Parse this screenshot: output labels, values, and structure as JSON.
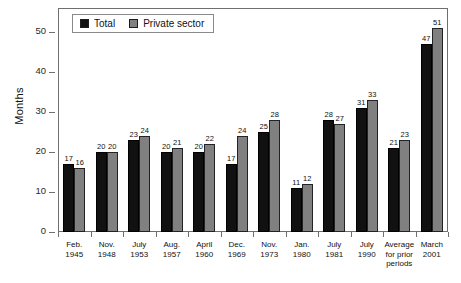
{
  "chart_data": {
    "type": "bar",
    "title": "",
    "xlabel": "",
    "ylabel": "Months",
    "ylim": [
      0,
      55
    ],
    "yticks": [
      0,
      10,
      20,
      30,
      40,
      50
    ],
    "grid": false,
    "legend_position": "top-left",
    "categories": [
      "Feb. 1945",
      "Nov. 1948",
      "July 1953",
      "Aug. 1957",
      "April 1960",
      "Dec. 1969",
      "Nov. 1973",
      "Jan. 1980",
      "July 1981",
      "July 1990",
      "Average for prior periods",
      "March 2001"
    ],
    "category_lines": [
      [
        "Feb.",
        "1945"
      ],
      [
        "Nov.",
        "1948"
      ],
      [
        "July",
        "1953"
      ],
      [
        "Aug.",
        "1957"
      ],
      [
        "April",
        "1960"
      ],
      [
        "Dec.",
        "1969"
      ],
      [
        "Nov.",
        "1973"
      ],
      [
        "Jan.",
        "1980"
      ],
      [
        "July",
        "1981"
      ],
      [
        "July",
        "1990"
      ],
      [
        "Average",
        "for prior",
        "periods"
      ],
      [
        "March",
        "2001"
      ]
    ],
    "series": [
      {
        "name": "Total",
        "color": "#111111",
        "values": [
          17,
          20,
          23,
          20,
          20,
          17,
          25,
          11,
          28,
          31,
          21,
          47
        ]
      },
      {
        "name": "Private sector",
        "color": "#808080",
        "values": [
          16,
          20,
          24,
          21,
          22,
          24,
          28,
          12,
          27,
          33,
          23,
          51
        ]
      }
    ]
  },
  "legend": {
    "items": [
      {
        "label": "Total",
        "color": "#111111"
      },
      {
        "label": "Private sector",
        "color": "#808080"
      }
    ]
  },
  "axis": {
    "y_title": "Months",
    "y_tick_labels": [
      "50",
      "40",
      "30",
      "20",
      "10",
      "0"
    ]
  }
}
